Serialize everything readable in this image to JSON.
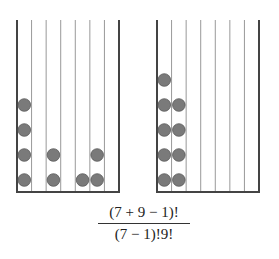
{
  "diagram": {
    "type": "stars-and-bars",
    "colors": {
      "frame": "#444444",
      "divider": "#999999",
      "ball": "#7a7a7a",
      "ball_edge": "#5a5a5a"
    },
    "left_box": {
      "bins": 7,
      "ball_counts": [
        4,
        0,
        2,
        0,
        1,
        2,
        0
      ]
    },
    "right_box": {
      "bins": 7,
      "ball_counts": [
        5,
        4,
        0,
        0,
        0,
        0,
        0
      ]
    }
  },
  "formula": {
    "numerator": "(7 + 9 − 1)!",
    "denominator": "(7 − 1)!9!"
  }
}
